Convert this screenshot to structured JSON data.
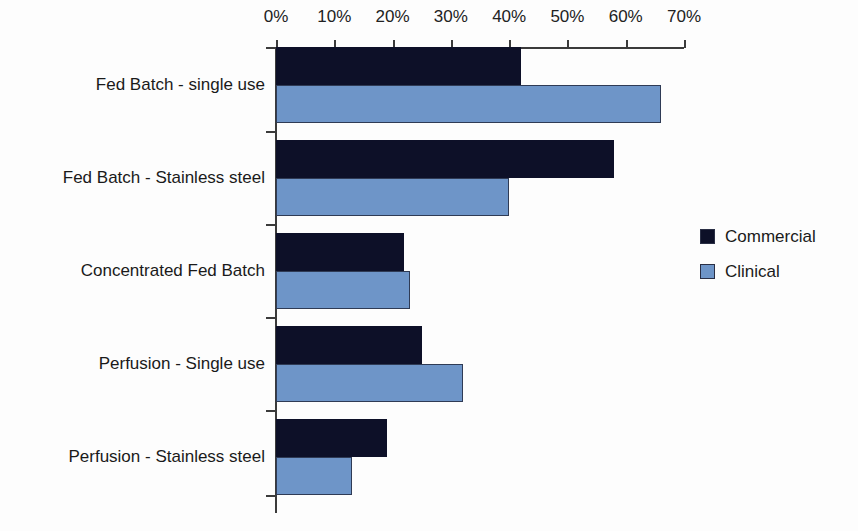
{
  "chart_data": {
    "type": "bar",
    "orientation": "horizontal",
    "title": "",
    "xlabel": "",
    "ylabel": "",
    "xlim": [
      0,
      70
    ],
    "xticks": [
      0,
      10,
      20,
      30,
      40,
      50,
      60,
      70
    ],
    "xtick_labels": [
      "0%",
      "10%",
      "20%",
      "30%",
      "40%",
      "50%",
      "60%",
      "70%"
    ],
    "grid": false,
    "legend_position": "right",
    "categories": [
      "Fed Batch - single use",
      "Fed Batch - Stainless steel",
      "Concentrated Fed Batch",
      "Perfusion - Single use",
      "Perfusion - Stainless steel"
    ],
    "series": [
      {
        "name": "Commercial",
        "color": "#0d1028",
        "values": [
          42,
          58,
          22,
          25,
          19
        ]
      },
      {
        "name": "Clinical",
        "color": "#6e95c8",
        "values": [
          66,
          40,
          23,
          32,
          13
        ]
      }
    ]
  },
  "legend": {
    "items": [
      {
        "label": "Commercial",
        "color": "#0d1028"
      },
      {
        "label": "Clinical",
        "color": "#6e95c8"
      }
    ]
  }
}
